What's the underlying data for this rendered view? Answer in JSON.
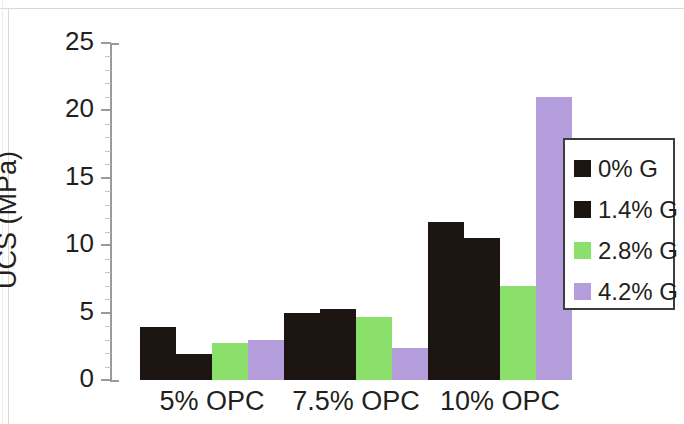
{
  "chart_data": {
    "type": "bar",
    "title": "",
    "xlabel": "",
    "ylabel": "UCS (MPa)",
    "categories": [
      "5% OPC",
      "7.5% OPC",
      "10% OPC"
    ],
    "series": [
      {
        "name": "0% G",
        "color": "#1c1512",
        "values": [
          3.9,
          5.0,
          11.7
        ]
      },
      {
        "name": "1.4% G",
        "color": "#1c1512",
        "values": [
          1.9,
          5.3,
          10.5
        ]
      },
      {
        "name": "2.8% G",
        "color": "#8ae06a",
        "values": [
          2.75,
          4.7,
          7.0
        ]
      },
      {
        "name": "4.2% G",
        "color": "#b49ddb",
        "values": [
          3.0,
          2.4,
          21.0
        ]
      }
    ],
    "ylim": [
      0,
      25
    ],
    "ytick_labels": [
      "0",
      "5",
      "10",
      "15",
      "20",
      "25"
    ],
    "ytick_values": [
      0,
      5,
      10,
      15,
      20,
      25
    ],
    "yminor_step": 1,
    "grid": false,
    "legend_position": "right"
  },
  "legend": {
    "entries": [
      {
        "label": "0% G",
        "color": "#1c1512"
      },
      {
        "label": "1.4% G",
        "color": "#1c1512"
      },
      {
        "label": "2.8% G",
        "color": "#8ae06a"
      },
      {
        "label": "4.2% G",
        "color": "#b49ddb"
      }
    ]
  },
  "axis": {
    "y_title": "UCS (MPa)"
  }
}
